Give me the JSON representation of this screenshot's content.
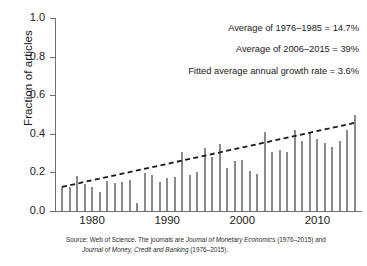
{
  "chart_data": {
    "type": "bar",
    "title": "",
    "subtitle": "",
    "xlabel": "",
    "ylabel": "Fraction of articles",
    "xlim": [
      1975.2,
      2015.8
    ],
    "ylim": [
      0.0,
      1.0
    ],
    "grid": false,
    "legend": "none",
    "ytick_labels": [
      "0.0",
      "0.2",
      "0.4",
      "0.6",
      "0.8",
      "1.0"
    ],
    "ytick_values": [
      0.0,
      0.2,
      0.4,
      0.6,
      0.8,
      1.0
    ],
    "xtick_labels": [
      "1980",
      "1990",
      "2000",
      "2010"
    ],
    "xtick_values": [
      1980,
      1990,
      2000,
      2010
    ],
    "minor_xticks_every": 1,
    "bar_color": "#8a8a8a",
    "trend_color": "#1a1a1a",
    "trend_style": "dashed",
    "categories": [
      1976,
      1977,
      1978,
      1979,
      1980,
      1981,
      1982,
      1983,
      1984,
      1985,
      1986,
      1987,
      1988,
      1989,
      1990,
      1991,
      1992,
      1993,
      1994,
      1995,
      1996,
      1997,
      1998,
      1999,
      2000,
      2001,
      2002,
      2003,
      2004,
      2005,
      2006,
      2007,
      2008,
      2009,
      2010,
      2011,
      2012,
      2013,
      2014,
      2015
    ],
    "values": [
      0.123,
      0.126,
      0.183,
      0.139,
      0.124,
      0.098,
      0.158,
      0.145,
      0.152,
      0.161,
      0.041,
      0.196,
      0.186,
      0.148,
      0.172,
      0.177,
      0.305,
      0.186,
      0.201,
      0.325,
      0.278,
      0.345,
      0.222,
      0.259,
      0.262,
      0.207,
      0.193,
      0.411,
      0.304,
      0.317,
      0.306,
      0.419,
      0.362,
      0.402,
      0.372,
      0.355,
      0.331,
      0.362,
      0.421,
      0.497
    ],
    "trend_series": {
      "name": "Fitted average annual growth",
      "x": [
        1976,
        2015
      ],
      "y": [
        0.125,
        0.457
      ]
    },
    "annotations": [
      "Average of 1976–1985 = 14.7%",
      "Average of 2006–2015 = 39%",
      "Fitted average annual growth rate = 3.6%"
    ]
  },
  "source_note": {
    "line1_pre": "Source: Web of Science. The journals are ",
    "line1_italic": "Journal of Monetary Economics",
    "line1_post": " (1976–2015) and",
    "line2_italic": "Journal of Money, Credit and Banking",
    "line2_post": " (1976–2015)."
  }
}
